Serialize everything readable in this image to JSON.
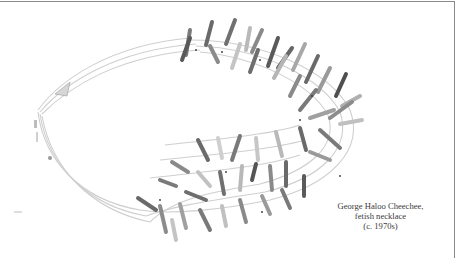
{
  "figure": {
    "caption": {
      "line1": "George Haloo Cheechee,",
      "line2": "fetish necklace",
      "line3": "(c. 1970s)"
    }
  },
  "colors": {
    "background": "#ffffff",
    "border": "#8a8a8a",
    "caption_text": "#3a3a3a",
    "strand": "#c9c9c9",
    "fetish_dark": "#5c5c5c",
    "fetish_mid": "#8f8f8f",
    "fetish_light": "#c4c4c4"
  }
}
